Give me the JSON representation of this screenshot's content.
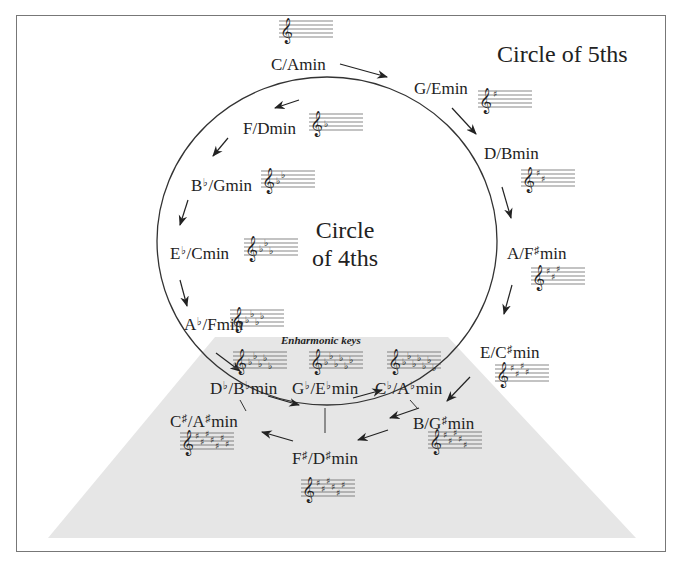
{
  "titles": {
    "circle_of_fifths": "Circle of 5ths",
    "circle_of_fourths_line1": "Circle",
    "circle_of_fourths_line2": "of 4ths",
    "enharmonic_label": "Enharmonic keys"
  },
  "keys": [
    {
      "id": "c",
      "major": "C",
      "major_acc": "",
      "minor": "A",
      "minor_acc": "",
      "suffix": "min",
      "signature": "none",
      "count": 0
    },
    {
      "id": "g",
      "major": "G",
      "major_acc": "",
      "minor": "E",
      "minor_acc": "",
      "suffix": "min",
      "signature": "sharp",
      "count": 1
    },
    {
      "id": "d",
      "major": "D",
      "major_acc": "",
      "minor": "B",
      "minor_acc": "",
      "suffix": "min",
      "signature": "sharp",
      "count": 2
    },
    {
      "id": "a",
      "major": "A",
      "major_acc": "",
      "minor": "F",
      "minor_acc": "♯",
      "suffix": "min",
      "signature": "sharp",
      "count": 3
    },
    {
      "id": "e",
      "major": "E",
      "major_acc": "",
      "minor": "C",
      "minor_acc": "♯",
      "suffix": "min",
      "signature": "sharp",
      "count": 4
    },
    {
      "id": "b",
      "major": "B",
      "major_acc": "",
      "minor": "G",
      "minor_acc": "♯",
      "suffix": "min",
      "signature": "sharp",
      "count": 5
    },
    {
      "id": "fs",
      "major": "F",
      "major_acc": "♯",
      "minor": "D",
      "minor_acc": "♯",
      "suffix": "min",
      "signature": "sharp",
      "count": 6
    },
    {
      "id": "cs",
      "major": "C",
      "major_acc": "♯",
      "minor": "A",
      "minor_acc": "♯",
      "suffix": "min",
      "signature": "sharp",
      "count": 7
    },
    {
      "id": "cb",
      "major": "C",
      "major_acc": "♭",
      "minor": "A",
      "minor_acc": "♭",
      "suffix": "min",
      "signature": "flat",
      "count": 7
    },
    {
      "id": "gb",
      "major": "G",
      "major_acc": "♭",
      "minor": "E",
      "minor_acc": "♭",
      "suffix": "min",
      "signature": "flat",
      "count": 6
    },
    {
      "id": "db",
      "major": "D",
      "major_acc": "♭",
      "minor": "B",
      "minor_acc": "♭",
      "suffix": "min",
      "signature": "flat",
      "count": 5
    },
    {
      "id": "ab",
      "major": "A",
      "major_acc": "♭",
      "minor": "F",
      "minor_acc": "",
      "suffix": "min",
      "signature": "flat",
      "count": 4
    },
    {
      "id": "eb",
      "major": "E",
      "major_acc": "♭",
      "minor": "C",
      "minor_acc": "",
      "suffix": "min",
      "signature": "flat",
      "count": 3
    },
    {
      "id": "bb",
      "major": "B",
      "major_acc": "♭",
      "minor": "G",
      "minor_acc": "",
      "suffix": "min",
      "signature": "flat",
      "count": 2
    },
    {
      "id": "f",
      "major": "F",
      "major_acc": "",
      "minor": "D",
      "minor_acc": "",
      "suffix": "min",
      "signature": "flat",
      "count": 1
    }
  ],
  "colors": {
    "ink": "#222222",
    "frame": "#777777",
    "enharmonic_region": "#e6e6e6",
    "staff": "#555555"
  }
}
